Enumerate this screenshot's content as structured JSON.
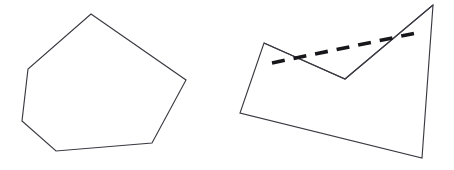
{
  "figure": {
    "background_color": "#ffffff",
    "width": 454,
    "height": 170,
    "stroke_color": "#3a3a42",
    "dash_color": "#17171b",
    "fill_color": "#ffffff",
    "outline_width": 1.15,
    "dash_width": 3.6,
    "dash_pattern": "13 9"
  },
  "shapes": {
    "left": {
      "label": "convex-polygon",
      "kind": "polygon",
      "vertex_count": 6,
      "points": "91,14 186,80 152,143 56,151 22,121 28,69",
      "vertices": [
        {
          "x": 91,
          "y": 14
        },
        {
          "x": 186,
          "y": 80
        },
        {
          "x": 152,
          "y": 143
        },
        {
          "x": 56,
          "y": 151
        },
        {
          "x": 22,
          "y": 121
        },
        {
          "x": 28,
          "y": 69
        }
      ]
    },
    "right": {
      "label": "non-convex-polygon",
      "kind": "polygon",
      "vertex_count": 5,
      "points": "264,43 345,79 433,5 422,158 240,113",
      "vertices": [
        {
          "x": 264,
          "y": 43
        },
        {
          "x": 345,
          "y": 79
        },
        {
          "x": 433,
          "y": 5
        },
        {
          "x": 422,
          "y": 158
        },
        {
          "x": 240,
          "y": 113
        }
      ],
      "notch": {
        "label": "reflex-notch",
        "points": "264,43 345,79 433,5",
        "apex": {
          "x": 345,
          "y": 79
        }
      }
    }
  },
  "annotations": {
    "dashed_chord": {
      "label": "dashed-chord",
      "start": {
        "x": 272,
        "y": 63
      },
      "end": {
        "x": 416,
        "y": 33
      },
      "points": "272,63 416,33"
    }
  }
}
